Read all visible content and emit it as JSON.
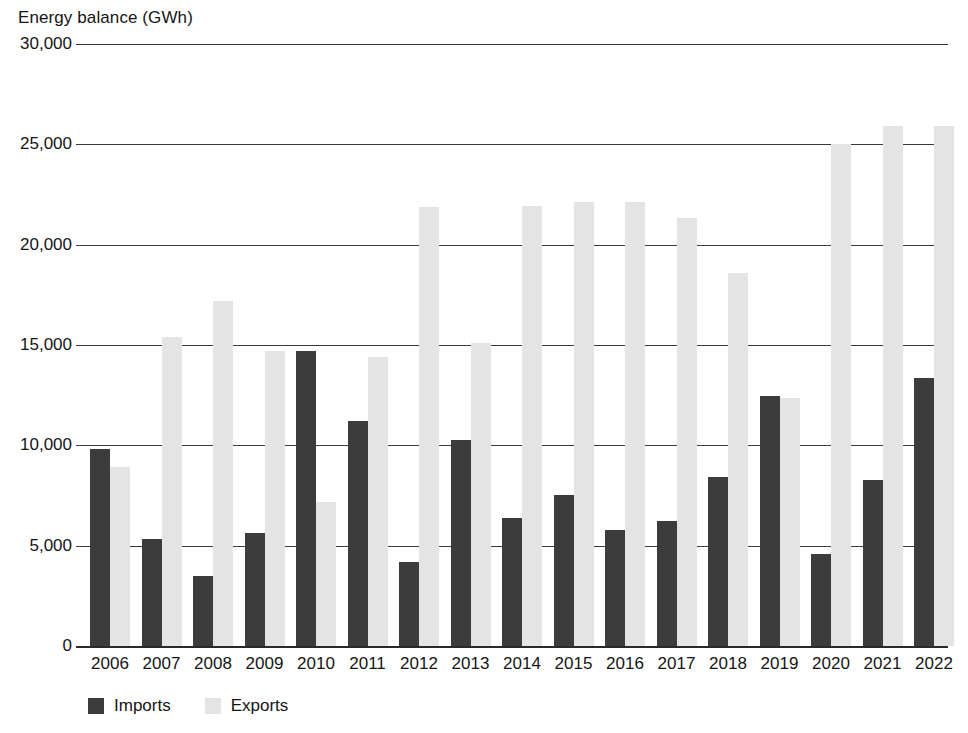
{
  "chart_data": {
    "type": "bar",
    "title": "Energy balance (GWh)",
    "xlabel": "",
    "ylabel": "",
    "ylim": [
      0,
      30000
    ],
    "ytick_values": [
      0,
      5000,
      10000,
      15000,
      20000,
      25000,
      30000
    ],
    "ytick_labels": [
      "0",
      "5,000",
      "10,000",
      "15,000",
      "20,000",
      "25,000",
      "30,000"
    ],
    "grid": true,
    "legend_position": "bottom-left",
    "categories": [
      "2006",
      "2007",
      "2008",
      "2009",
      "2010",
      "2011",
      "2012",
      "2013",
      "2014",
      "2015",
      "2016",
      "2017",
      "2018",
      "2019",
      "2020",
      "2021",
      "2022"
    ],
    "series": [
      {
        "name": "Imports",
        "color": "#3c3c3c",
        "values": [
          9800,
          5350,
          3500,
          5650,
          14700,
          11200,
          4200,
          10250,
          6400,
          7550,
          5800,
          6250,
          8400,
          12450,
          4600,
          8250,
          13350
        ]
      },
      {
        "name": "Exports",
        "color": "#e4e4e4",
        "values": [
          8900,
          15400,
          17200,
          14700,
          7200,
          14400,
          21900,
          15100,
          21950,
          22150,
          22150,
          21350,
          18600,
          12350,
          25000,
          25900,
          25900
        ]
      }
    ]
  },
  "axis": {
    "gridline_color": "#3a3a3a",
    "baseline_color": "#2a2a2a"
  }
}
